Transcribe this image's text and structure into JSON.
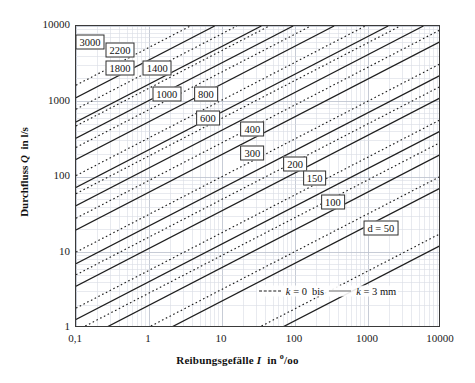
{
  "chart_data": {
    "type": "line",
    "title": "",
    "xlabel_parts": {
      "text": "Reibungsgefälle",
      "symbol": "I",
      "in": "in",
      "unit_sup": "o",
      "unit_rest": "/oo"
    },
    "ylabel_parts": {
      "text": "Durchfluss",
      "symbol": "Q",
      "in": "in",
      "unit": "l/s"
    },
    "xscale": "log",
    "yscale": "log",
    "xlim": [
      0.1,
      10000
    ],
    "ylim": [
      1,
      10000
    ],
    "xticks": [
      0.1,
      1,
      10,
      100,
      1000,
      10000
    ],
    "xtick_labels": [
      "0,1",
      "1",
      "10",
      "100",
      "1000",
      "10000"
    ],
    "yticks": [
      1,
      10,
      100,
      1000,
      10000
    ],
    "ytick_labels": [
      "1",
      "10",
      "100",
      "1000",
      "10000"
    ],
    "grid": true,
    "grid_minor": true,
    "legend_position": "inside-bottom-right",
    "legend": [
      {
        "label_symbol": "k",
        "label_value": "= 0",
        "style": "dashed",
        "connector": "bis"
      },
      {
        "label_symbol": "k",
        "label_value": "= 3 mm",
        "style": "solid",
        "connector": ""
      }
    ],
    "series_note": "Each pipe diameter d (mm) is drawn as a pair: dashed line for k = 0 and solid line for k = 3 mm. Q = a * I^0.5 (l/s), I in per mille.",
    "slope_loglog": 0.5,
    "series": [
      {
        "name": "3000",
        "label": "3000",
        "d_mm": 3000,
        "a_solid": 3550,
        "a_dashed": 5200,
        "label_x": 0.155,
        "label_y": 6100
      },
      {
        "name": "2200",
        "label": "2200",
        "d_mm": 2200,
        "a_solid": 1700,
        "a_dashed": 2500,
        "label_x": 0.4,
        "label_y": 4800
      },
      {
        "name": "1800",
        "label": "1800",
        "d_mm": 1800,
        "a_solid": 1030,
        "a_dashed": 1500,
        "label_x": 0.4,
        "label_y": 2750
      },
      {
        "name": "1400",
        "label": "1400",
        "d_mm": 1400,
        "a_solid": 540,
        "a_dashed": 780,
        "label_x": 1.3,
        "label_y": 2750
      },
      {
        "name": "1000",
        "label": "1000",
        "d_mm": 1000,
        "a_solid": 230,
        "a_dashed": 330,
        "label_x": 1.75,
        "label_y": 1250
      },
      {
        "name": "800",
        "label": "800",
        "d_mm": 800,
        "a_solid": 132,
        "a_dashed": 190,
        "label_x": 6.0,
        "label_y": 1250
      },
      {
        "name": "600",
        "label": "600",
        "d_mm": 600,
        "a_solid": 63,
        "a_dashed": 90,
        "label_x": 6.4,
        "label_y": 610
      },
      {
        "name": "400",
        "label": "400",
        "d_mm": 400,
        "a_solid": 22.5,
        "a_dashed": 32,
        "label_x": 26.0,
        "label_y": 430
      },
      {
        "name": "300",
        "label": "300",
        "d_mm": 300,
        "a_solid": 11.3,
        "a_dashed": 16,
        "label_x": 26.0,
        "label_y": 205
      },
      {
        "name": "200",
        "label": "200",
        "d_mm": 200,
        "a_solid": 4.1,
        "a_dashed": 5.8,
        "label_x": 100.0,
        "label_y": 148
      },
      {
        "name": "150",
        "label": "150",
        "d_mm": 150,
        "a_solid": 2.0,
        "a_dashed": 2.9,
        "label_x": 185.0,
        "label_y": 98
      },
      {
        "name": "100",
        "label": "100",
        "d_mm": 100,
        "a_solid": 0.72,
        "a_dashed": 1.03,
        "label_x": 330.0,
        "label_y": 46
      },
      {
        "name": "d = 50",
        "label": "d = 50",
        "d_mm": 50,
        "a_solid": 0.125,
        "a_dashed": 0.18,
        "label_x": 1500.0,
        "label_y": 21
      }
    ]
  },
  "legend_text": {
    "dash_symbol": "k",
    "dash_value": "= 0",
    "bis": "bis",
    "solid_symbol": "k",
    "solid_value": "= 3 mm"
  },
  "colors": {
    "solid_line": "#1f1f1f",
    "dashed_line": "#1f1f1f",
    "grid_major": "#b9bfcc",
    "grid_minor": "#d8dce5",
    "frame": "#3a3a3a",
    "text": "#111111",
    "legend_solid_swatch": "#6b6b6b"
  }
}
